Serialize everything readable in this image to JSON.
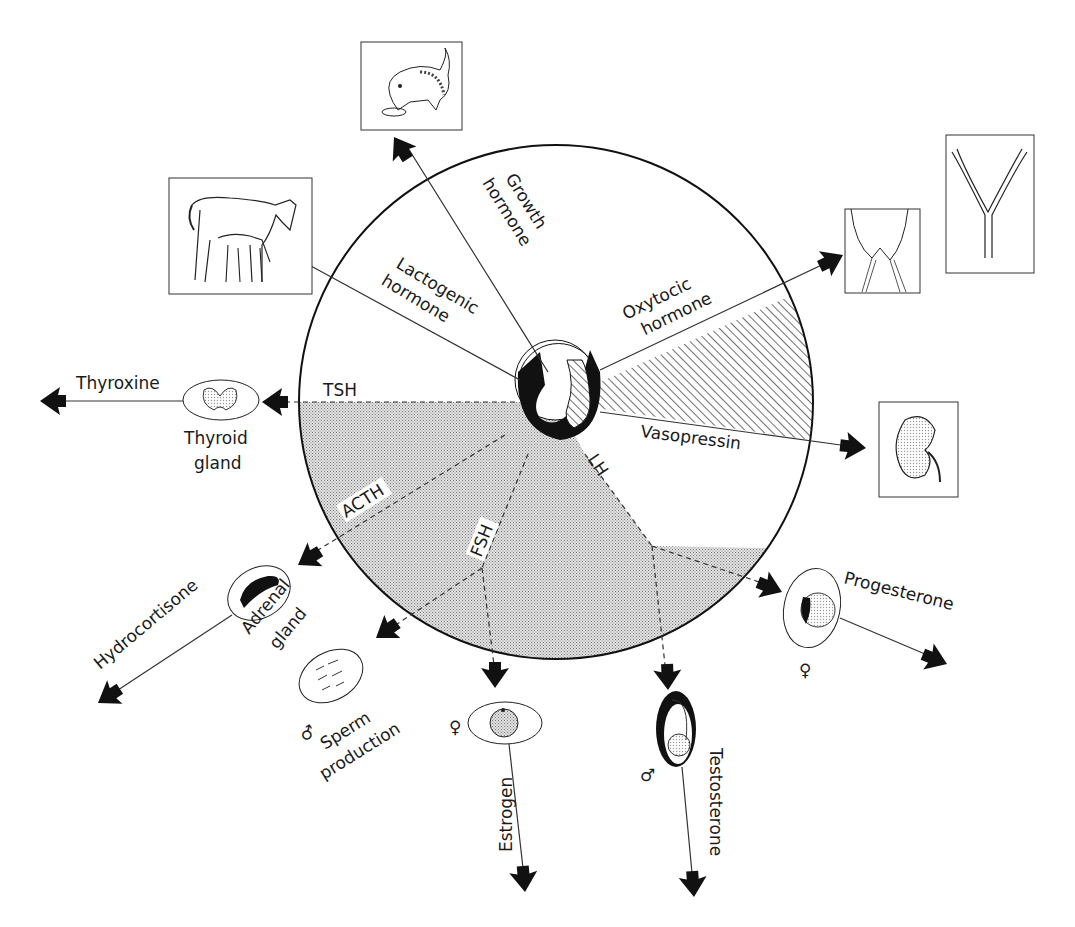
{
  "diagram": {
    "center_gland": "Pituitary gland (anterior and posterior lobes)",
    "hormones": {
      "growth": {
        "line1": "Growth",
        "line2": "hormone"
      },
      "lactogenic": {
        "line1": "Lactogenic",
        "line2": "hormone"
      },
      "oxytocic": {
        "line1": "Oxytocic",
        "line2": "hormone"
      },
      "vasopressin": "Vasopressin",
      "tsh": "TSH",
      "acth": "ACTH",
      "fsh": "FSH",
      "lh": "LH"
    },
    "targets": {
      "thyroxine": "Thyroxine",
      "thyroid_gland": {
        "line1": "Thyroid",
        "line2": "gland"
      },
      "hydrocortisone": "Hydrocortisone",
      "adrenal_gland": {
        "line1": "Adrenal",
        "line2": "gland"
      },
      "sperm_production": {
        "line1": "Sperm",
        "line2": "production"
      },
      "male_symbol": "♂",
      "female_symbol": "♀",
      "estrogen": "Estrogen",
      "testosterone": "Testosterone",
      "progesterone": "Progesterone"
    },
    "illustrations": {
      "puppy": "puppy-illustration",
      "mare_foal": "mare-and-foal-illustration",
      "mammary": "mammary-gland-illustration",
      "uterus": "uterus-illustration",
      "kidney": "kidney-illustration",
      "thyroid": "thyroid-illustration",
      "adrenal": "adrenal-illustration",
      "testis_tubules": "seminiferous-tubules-illustration",
      "ovary_follicle": "ovarian-follicle-illustration",
      "testis": "testis-illustration",
      "corpus_luteum": "corpus-luteum-illustration"
    },
    "colors": {
      "ink": "#111111",
      "stipple": "#bdbdbd",
      "paper": "#ffffff"
    }
  }
}
